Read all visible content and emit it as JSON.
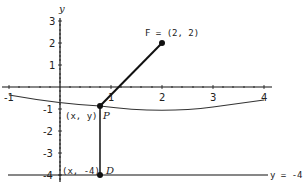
{
  "diagram": {
    "type": "parabola-focus-directrix",
    "axes": {
      "x_axis_label": "",
      "y_axis_label": "y",
      "x_ticks": [
        "-1",
        "1",
        "2",
        "3",
        "4"
      ],
      "y_ticks": [
        "3",
        "2",
        "1",
        "-1",
        "-2",
        "-3",
        "-4"
      ],
      "x_range": [
        -1,
        4
      ],
      "y_range": [
        -4,
        3
      ]
    },
    "focus": {
      "label": "F = (2, 2)",
      "x": 2,
      "y": 2
    },
    "point_p": {
      "coord_label": "(x, y)",
      "name": "P"
    },
    "point_d": {
      "coord_label": "(x, -4)",
      "name": "D"
    },
    "directrix": {
      "label": "y = -4",
      "y": -4
    },
    "colors": {
      "line": "#111111",
      "curve": "#333333",
      "background": "#ffffff"
    }
  }
}
